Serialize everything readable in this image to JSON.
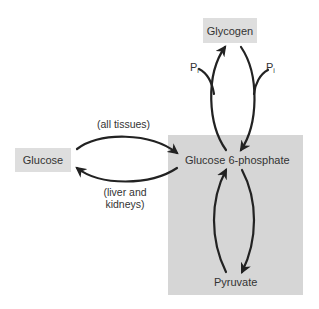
{
  "diagram": {
    "title": "",
    "nodes": {
      "glycogen": {
        "label": "Glycogen"
      },
      "glucose": {
        "label": "Glucose"
      },
      "g6p": {
        "label": "Glucose 6-phosphate"
      },
      "pyruvate": {
        "label": "Pyruvate"
      }
    },
    "edge_labels": {
      "all_tissues": "(all tissues)",
      "liver_line1": "(liver and",
      "liver_line2": "kidneys)",
      "pi_left_main": "P",
      "pi_left_sub": "i",
      "pi_right_main": "P",
      "pi_right_sub": "i"
    },
    "edges": [
      {
        "from": "Glucose",
        "to": "Glucose 6-phosphate",
        "label": "(all tissues)"
      },
      {
        "from": "Glucose 6-phosphate",
        "to": "Glucose",
        "label": "(liver and kidneys)"
      },
      {
        "from": "Glucose 6-phosphate",
        "to": "Glycogen",
        "label": ""
      },
      {
        "from": "Glycogen",
        "to": "Glucose 6-phosphate",
        "label": "Pi"
      },
      {
        "from": "Pyruvate",
        "to": "Glucose 6-phosphate",
        "label": ""
      },
      {
        "from": "Glucose 6-phosphate",
        "to": "Pyruvate",
        "label": ""
      }
    ],
    "colors": {
      "region_fill": "#d6d6d6",
      "node_fill": "#dedede",
      "arrow": "#222222",
      "text": "#333333"
    }
  }
}
